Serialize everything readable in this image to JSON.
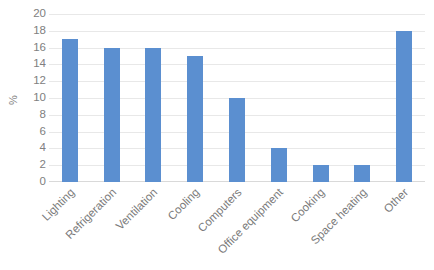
{
  "chart_data": {
    "type": "bar",
    "title": "",
    "subtitle": "",
    "xlabel": "",
    "ylabel": "%",
    "categories": [
      "Lighting",
      "Refrigeration",
      "Ventilation",
      "Cooling",
      "Computers",
      "Office equipment",
      "Cooking",
      "Space heating",
      "Other"
    ],
    "values": [
      17,
      16,
      16,
      15,
      10,
      4,
      2,
      2,
      18
    ],
    "ylim": [
      0,
      20
    ],
    "ytick_step": 2,
    "yticks": [
      20,
      18,
      16,
      14,
      12,
      10,
      8,
      6,
      4,
      2,
      0
    ],
    "grid": true,
    "grid_axis": "y",
    "legend": false,
    "legend_position": "none",
    "xtick_rotation": -45,
    "series": [
      {
        "name": "%",
        "values": [
          17,
          16,
          16,
          15,
          10,
          4,
          2,
          2,
          18
        ]
      }
    ]
  },
  "style": {
    "bar_color": "#5b8fd0",
    "grid_color": "#e8e8e8",
    "axis_color": "#d9d9d9",
    "tick_text_color": "#808080",
    "category_text_color": "#7a7a7a",
    "background": "#ffffff"
  }
}
